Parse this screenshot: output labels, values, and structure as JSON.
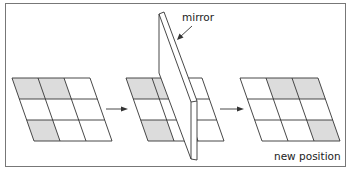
{
  "diagram": {
    "labels": {
      "mirror": "mirror",
      "new_position": "new position"
    },
    "colors": {
      "frame": "#777777",
      "line": "#333333",
      "shaded": "#dcdcdc",
      "background": "#ffffff"
    },
    "grids": [
      {
        "name": "original-grid",
        "rows": 3,
        "cols": 3,
        "shaded_cells": [
          [
            0,
            0
          ],
          [
            0,
            1
          ],
          [
            2,
            0
          ]
        ]
      },
      {
        "name": "grid-with-mirror",
        "rows": 3,
        "cols": 3,
        "shaded_cells": [
          [
            0,
            0
          ],
          [
            0,
            1
          ],
          [
            2,
            0
          ]
        ]
      },
      {
        "name": "reflected-grid",
        "rows": 3,
        "cols": 3,
        "shaded_cells": [
          [
            0,
            1
          ],
          [
            0,
            2
          ],
          [
            2,
            2
          ]
        ]
      }
    ],
    "arrows": [
      {
        "from": "original-grid",
        "to": "grid-with-mirror"
      },
      {
        "from": "grid-with-mirror",
        "to": "reflected-grid"
      }
    ]
  }
}
